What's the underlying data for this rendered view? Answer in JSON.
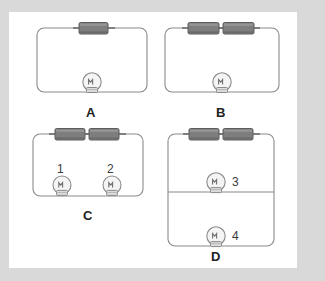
{
  "figure": {
    "kind": "circuit-diagram",
    "background_color": "#d9d9d9",
    "panel_color": "#ffffff",
    "wire_color": "#8a8a8a",
    "battery_body_color": "#7e7e7e",
    "battery_outline_color": "#5a5a5a",
    "bulb_glass_color": "#f2f2f2",
    "bulb_outline_color": "#8a8a8a",
    "bulb_base_color": "#dcdcdc",
    "label_color": "#222222"
  },
  "circuits": [
    {
      "id": "A",
      "label": "A",
      "batteries": 1,
      "bulbs": 1,
      "bulb_labels": [],
      "wiring": "series",
      "description": "One cell in series with one bulb"
    },
    {
      "id": "B",
      "label": "B",
      "batteries": 2,
      "bulbs": 1,
      "bulb_labels": [],
      "wiring": "series",
      "description": "Two cells in series with one bulb"
    },
    {
      "id": "C",
      "label": "C",
      "batteries": 2,
      "bulbs": 2,
      "bulb_labels": [
        "1",
        "2"
      ],
      "wiring": "series",
      "description": "Two cells in series with two bulbs in series"
    },
    {
      "id": "D",
      "label": "D",
      "batteries": 2,
      "bulbs": 2,
      "bulb_labels": [
        "3",
        "4"
      ],
      "wiring": "parallel",
      "description": "Two cells in series with two bulbs in parallel"
    }
  ],
  "icons": {
    "battery": "battery-cell-icon",
    "bulb": "light-bulb-icon",
    "wire": "wire-segment"
  }
}
